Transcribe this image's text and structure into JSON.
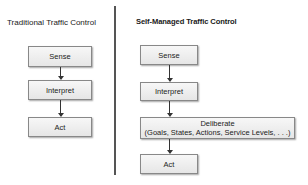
{
  "left_panel": {
    "title": "Traditional Traffic Control",
    "steps": [
      "Sense",
      "Interpret",
      "Act"
    ]
  },
  "right_panel": {
    "title": "Self-Managed Traffic Control",
    "steps": [
      {
        "label": "Sense"
      },
      {
        "label": "Interpret"
      },
      {
        "label": "Deliberate",
        "sublabel": "(Goals, States, Actions, Service Levels, . . .)"
      },
      {
        "label": "Act"
      }
    ]
  }
}
